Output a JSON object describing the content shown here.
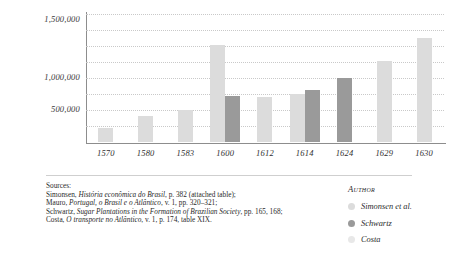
{
  "chart_data": {
    "type": "bar",
    "title": "",
    "xlabel": "",
    "ylabel": "",
    "ylim": [
      0,
      1600000
    ],
    "grid": true,
    "gridlines": [
      200000,
      400000,
      600000,
      800000,
      1000000,
      1200000,
      1400000,
      1600000
    ],
    "y_ticks": [
      "500,000",
      "1,000,000",
      "1,500,000"
    ],
    "y_tick_values": [
      500000,
      1000000,
      1500000
    ],
    "categories": [
      "1570",
      "1580",
      "1583",
      "1600",
      "1612",
      "1614",
      "1624",
      "1629",
      "1630"
    ],
    "legend_position": "bottom-right",
    "legend_title": "Author",
    "series": [
      {
        "name": "Simonsen et al.",
        "color": "#dcdcdc",
        "values": [
          180000,
          330000,
          400000,
          1210000,
          560000,
          600000,
          null,
          1010000,
          1300000
        ]
      },
      {
        "name": "Schwartz",
        "color": "#9a9a9a",
        "values": [
          null,
          null,
          null,
          570000,
          null,
          650000,
          800000,
          null,
          null
        ]
      },
      {
        "name": "Costa",
        "color": "#e8e8e8",
        "values": [
          null,
          null,
          null,
          null,
          null,
          null,
          null,
          null,
          null
        ]
      }
    ]
  },
  "sources": {
    "heading": "Sources:",
    "lines": [
      {
        "pre": "Simonsen, ",
        "italic": "História econômica do Brasil",
        "post": ", p. 382 (attached table);"
      },
      {
        "pre": "Mauro, ",
        "italic": "Portugal, o Brasil e o Atlântico",
        "post": ", v. 1, pp. 320–321;"
      },
      {
        "pre": "Schwartz, ",
        "italic": "Sugar Plantations in the Formation of Brazilian Society",
        "post": ", pp. 165, 168;"
      },
      {
        "pre": "Costa, ",
        "italic": "O transporte no Atlântico",
        "post": ", v. 1, p. 174, table XIX."
      }
    ]
  },
  "legend": {
    "title": "Author",
    "items": [
      {
        "label": "Simonsen et al.",
        "color": "#dcdcdc"
      },
      {
        "label": "Schwartz",
        "color": "#9a9a9a"
      },
      {
        "label": "Costa",
        "color": "#e8e8e8"
      }
    ]
  }
}
